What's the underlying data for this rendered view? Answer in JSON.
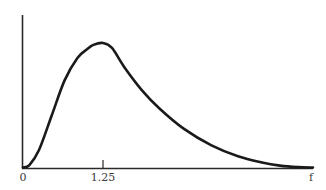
{
  "chart_data": {
    "type": "line",
    "title": "",
    "xlabel": "f",
    "ylabel": "",
    "x_ticks": [
      {
        "value": 0,
        "label": "0"
      },
      {
        "value": 1.25,
        "label": "1.25"
      }
    ],
    "x_axis_end_label": "f",
    "y_ticks": [],
    "grid": false,
    "legend": null,
    "xlim": [
      0,
      4.75
    ],
    "ylim": [
      0,
      1.0
    ],
    "series": [
      {
        "name": "density",
        "description": "Right-skewed unimodal distribution peaking at f = 1.25",
        "x": [
          0,
          0.1,
          0.25,
          0.45,
          0.65,
          0.85,
          1.0,
          1.1,
          1.25,
          1.4,
          1.6,
          1.9,
          2.2,
          2.6,
          3.05,
          3.5,
          3.9,
          4.2,
          4.5,
          4.75
        ],
        "y": [
          0,
          0.02,
          0.14,
          0.42,
          0.7,
          0.88,
          0.95,
          0.985,
          1.0,
          0.96,
          0.81,
          0.62,
          0.47,
          0.31,
          0.18,
          0.09,
          0.04,
          0.015,
          0.003,
          0
        ]
      }
    ],
    "annotations": [],
    "colors": {
      "curve": "#1a1a1a",
      "axis": "#2a2a2a",
      "background": "#ffffff"
    }
  },
  "labels": {
    "origin": "0",
    "peak_tick": "1.25",
    "x_end": "f"
  }
}
